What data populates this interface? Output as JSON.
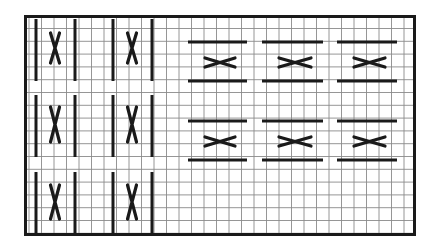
{
  "diagram": {
    "title": "",
    "type": "cable-cross pattern chart",
    "colors": {
      "ink": "#1a1a1a",
      "grid": "#8a8a8a",
      "background": "#ffffff"
    },
    "grid": {
      "columns": 31,
      "rows": 17
    },
    "left_panel": {
      "orientation": "vertical",
      "rows": 3,
      "units_per_row": 2,
      "symbol": "vertical-cross",
      "units": [
        {
          "row": 1,
          "col": 1
        },
        {
          "row": 1,
          "col": 2
        },
        {
          "row": 2,
          "col": 1
        },
        {
          "row": 2,
          "col": 2
        },
        {
          "row": 3,
          "col": 1
        },
        {
          "row": 3,
          "col": 2
        }
      ]
    },
    "right_panel": {
      "orientation": "horizontal",
      "rows": 2,
      "units_per_row": 3,
      "symbol": "horizontal-cross",
      "units": [
        {
          "row": 1,
          "col": 1
        },
        {
          "row": 1,
          "col": 2
        },
        {
          "row": 1,
          "col": 3
        },
        {
          "row": 2,
          "col": 1
        },
        {
          "row": 2,
          "col": 2
        },
        {
          "row": 2,
          "col": 3
        }
      ]
    }
  }
}
